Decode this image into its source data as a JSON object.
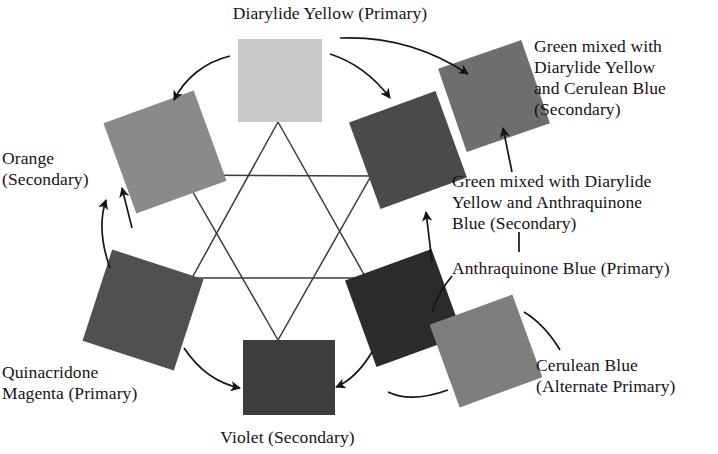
{
  "diagram": {
    "background_color": "#ffffff",
    "line_color": "#3c3c3c"
  },
  "labels": {
    "diarylide_yellow": "Diarylide Yellow (Primary)",
    "orange": "Orange\n(Secondary)",
    "quinacridone_magenta": "Quinacridone\nMagenta (Primary)",
    "violet": "Violet (Secondary)",
    "green_cerulean": "Green mixed with\nDiarylide Yellow\nand Cerulean Blue\n(Secondary)",
    "green_anthraquinone": "Green mixed with Diarylide\nYellow and Anthraquinone\nBlue (Secondary)",
    "anthraquinone_blue": "Anthraquinone Blue (Primary)",
    "cerulean_blue": "Cerulean Blue\n(Alternate Primary)"
  },
  "swatches": [
    {
      "id": "diarylide-yellow",
      "name": "Diarylide Yellow",
      "role": "Primary",
      "fill": "#c9c9c9",
      "x": 238,
      "y": 39,
      "w": 84,
      "h": 83,
      "rotation": 0
    },
    {
      "id": "green-cerulean",
      "name": "Green mixed with Diarylide Yellow and Cerulean Blue",
      "role": "Secondary",
      "fill": "#6e6e6e",
      "x": 450,
      "y": 52,
      "w": 88,
      "h": 88,
      "rotation": -19
    },
    {
      "id": "green-anthraquinone",
      "name": "Green mixed with Diarylide Yellow and Anthraquinone Blue",
      "role": "Secondary",
      "fill": "#4a4a4a",
      "x": 362,
      "y": 104,
      "w": 92,
      "h": 92,
      "rotation": -20
    },
    {
      "id": "anthraquinone-blue",
      "name": "Anthraquinone Blue",
      "role": "Primary",
      "fill": "#2b2b2b",
      "x": 358,
      "y": 262,
      "w": 92,
      "h": 92,
      "rotation": -20
    },
    {
      "id": "cerulean-blue",
      "name": "Cerulean Blue",
      "role": "Alternate Primary",
      "fill": "#7e7e7e",
      "x": 442,
      "y": 307,
      "w": 88,
      "h": 88,
      "rotation": -20
    },
    {
      "id": "violet",
      "name": "Violet",
      "role": "Secondary",
      "fill": "#3d3d3d",
      "x": 243,
      "y": 340,
      "w": 92,
      "h": 75,
      "rotation": 0
    },
    {
      "id": "quinacridone-magenta",
      "name": "Quinacridone Magenta",
      "role": "Primary",
      "fill": "#505050",
      "x": 95,
      "y": 262,
      "w": 96,
      "h": 96,
      "rotation": 18
    },
    {
      "id": "orange",
      "name": "Orange",
      "role": "Secondary",
      "fill": "#8a8a8a",
      "x": 117,
      "y": 104,
      "w": 96,
      "h": 96,
      "rotation": -20
    }
  ],
  "hexagram": {
    "up_triangle": "278,122 366,278 192,278",
    "down_triangle": "278,340 183,175 371,176"
  },
  "mixing_arrows": [
    {
      "id": "yellow-to-orange",
      "from": "Diarylide Yellow",
      "to": "Orange"
    },
    {
      "id": "yellow-to-green",
      "from": "Diarylide Yellow",
      "to": "Green"
    },
    {
      "id": "magenta-to-violet",
      "from": "Quinacridone Magenta",
      "to": "Violet"
    },
    {
      "id": "blue-to-violet",
      "from": "Anthraquinone Blue",
      "to": "Violet"
    },
    {
      "id": "magenta-to-orange",
      "from": "Quinacridone Magenta",
      "to": "Orange"
    },
    {
      "id": "cerulean-to-green",
      "from": "Cerulean Blue",
      "to": "Green"
    }
  ],
  "leader_lines": [
    {
      "id": "leader-green-cerulean",
      "target": "green-cerulean"
    },
    {
      "id": "leader-green-anthra",
      "target": "green-anthraquinone"
    },
    {
      "id": "leader-anthraquinone",
      "target": "anthraquinone-blue"
    },
    {
      "id": "leader-cerulean",
      "target": "cerulean-blue"
    },
    {
      "id": "leader-yellow",
      "target": "diarylide-yellow"
    },
    {
      "id": "leader-violet",
      "target": "violet"
    }
  ]
}
